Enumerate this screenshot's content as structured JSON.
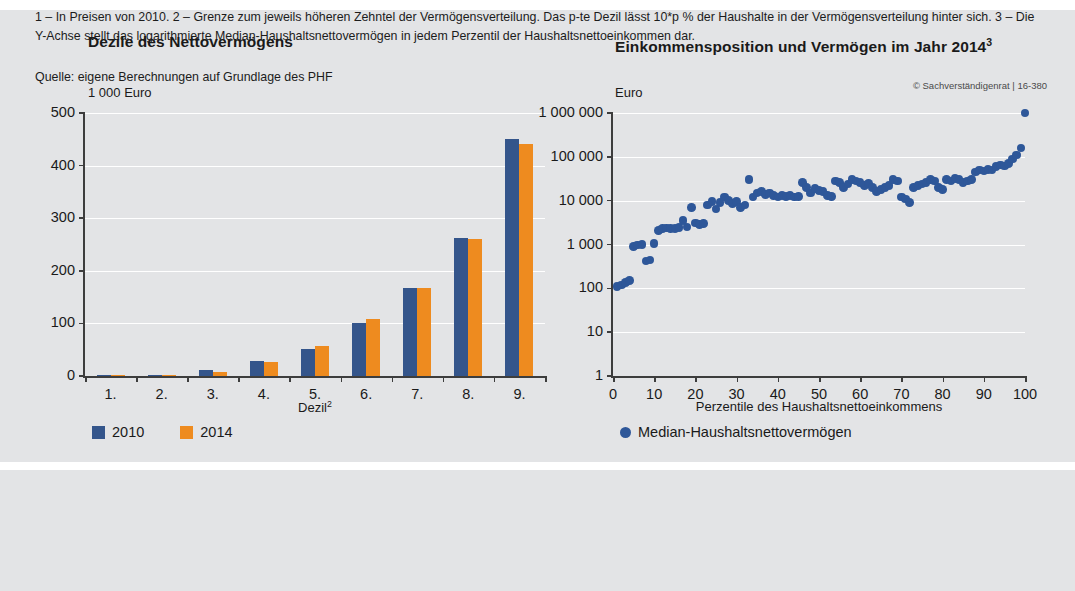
{
  "left_chart": {
    "title": "Dezile des Nettovermögens",
    "y_unit": "1 000 Euro",
    "x_axis_label": "Dezil",
    "x_axis_label_sup": "2",
    "y_ticks": [
      "0",
      "100",
      "200",
      "300",
      "400",
      "500"
    ],
    "x_ticks": [
      "1.",
      "2.",
      "3.",
      "4.",
      "5.",
      "6.",
      "7.",
      "8.",
      "9."
    ],
    "legend": [
      {
        "label": "2010",
        "color": "#34558b"
      },
      {
        "label": "2014",
        "color": "#ee8b1f"
      }
    ]
  },
  "right_chart": {
    "title": "Einkommensposition und Vermögen im Jahr 2014",
    "title_sup": "3",
    "y_unit": "Euro",
    "x_axis_label": "Perzentile des Haushaltsnettoeinkommens",
    "y_ticks": [
      "1",
      "10",
      "100",
      "1 000",
      "10 000",
      "100 000",
      "1 000 000"
    ],
    "x_ticks": [
      "0",
      "10",
      "20",
      "30",
      "40",
      "50",
      "60",
      "70",
      "80",
      "90",
      "100"
    ],
    "legend": [
      {
        "label": "Median-Haushaltsnettovermögen",
        "color": "#2e5799"
      }
    ]
  },
  "footnotes": "1 – In Preisen von 2010.  2 – Grenze zum jeweils höheren Zehntel der Vermögensverteilung. Das p-te Dezil lässt 10*p % der Haushalte in der Vermögensverteilung hinter sich.  3 – Die Y-Achse stellt das logarithmierte Median-Haushaltsnettovermögen in jedem Perzentil der Haushaltsnettoeinkommen dar.",
  "source": "Quelle: eigene Berechnungen auf Grundlage des PHF",
  "copyright": "© Sachverständigenrat | 16-380",
  "colors": {
    "background": "#e3e4e6",
    "series_2010": "#34558b",
    "series_2014": "#ee8b1f",
    "scatter": "#2e5799",
    "axis": "#3d3d3d",
    "gridline": "#ffffff"
  },
  "chart_data": [
    {
      "type": "bar",
      "title": "Dezile des Nettovermögens",
      "xlabel": "Dezil",
      "ylabel": "1 000 Euro",
      "ylim": [
        0,
        500
      ],
      "grid": true,
      "legend_position": "bottom-left",
      "categories": [
        "1.",
        "2.",
        "3.",
        "4.",
        "5.",
        "6.",
        "7.",
        "8.",
        "9."
      ],
      "series": [
        {
          "name": "2010",
          "color": "#34558b",
          "values": [
            0.3,
            2.5,
            11,
            28,
            51,
            100,
            168,
            262,
            450
          ]
        },
        {
          "name": "2014",
          "color": "#ee8b1f",
          "values": [
            0.2,
            1.8,
            8,
            26,
            58,
            108,
            168,
            260,
            441
          ]
        }
      ]
    },
    {
      "type": "scatter",
      "title": "Einkommensposition und Vermögen im Jahr 2014",
      "xlabel": "Perzentile des Haushaltsnettoeinkommens",
      "ylabel": "Euro",
      "yscale": "log",
      "ylim": [
        1,
        1000000
      ],
      "xlim": [
        0,
        100
      ],
      "grid": true,
      "legend_position": "bottom-left",
      "series": [
        {
          "name": "Median-Haushaltsnettovermögen",
          "color": "#2e5799",
          "points": [
            [
              1,
              110
            ],
            [
              2,
              120
            ],
            [
              3,
              135
            ],
            [
              4,
              150
            ],
            [
              5,
              900
            ],
            [
              6,
              980
            ],
            [
              7,
              1000
            ],
            [
              8,
              420
            ],
            [
              9,
              440
            ],
            [
              10,
              1050
            ],
            [
              11,
              2100
            ],
            [
              12,
              2300
            ],
            [
              13,
              2400
            ],
            [
              14,
              2300
            ],
            [
              15,
              2350
            ],
            [
              16,
              2450
            ],
            [
              17,
              3500
            ],
            [
              18,
              2500
            ],
            [
              19,
              7000
            ],
            [
              20,
              3100
            ],
            [
              21,
              2900
            ],
            [
              22,
              3000
            ],
            [
              23,
              8000
            ],
            [
              24,
              9500
            ],
            [
              25,
              6500
            ],
            [
              26,
              9000
            ],
            [
              27,
              12000
            ],
            [
              28,
              10000
            ],
            [
              29,
              8500
            ],
            [
              30,
              9500
            ],
            [
              31,
              7000
            ],
            [
              32,
              8000
            ],
            [
              33,
              30000
            ],
            [
              34,
              12000
            ],
            [
              35,
              15000
            ],
            [
              36,
              16000
            ],
            [
              37,
              14000
            ],
            [
              38,
              15000
            ],
            [
              39,
              13000
            ],
            [
              40,
              12000
            ],
            [
              41,
              13000
            ],
            [
              42,
              12500
            ],
            [
              43,
              13000
            ],
            [
              44,
              12000
            ],
            [
              45,
              12500
            ],
            [
              46,
              26000
            ],
            [
              47,
              20000
            ],
            [
              48,
              15000
            ],
            [
              49,
              19000
            ],
            [
              50,
              17000
            ],
            [
              51,
              16000
            ],
            [
              52,
              13000
            ],
            [
              53,
              12500
            ],
            [
              54,
              28000
            ],
            [
              55,
              26000
            ],
            [
              56,
              20000
            ],
            [
              57,
              24000
            ],
            [
              58,
              30000
            ],
            [
              59,
              28000
            ],
            [
              60,
              26000
            ],
            [
              61,
              22000
            ],
            [
              62,
              25000
            ],
            [
              63,
              20000
            ],
            [
              64,
              16000
            ],
            [
              65,
              18000
            ],
            [
              66,
              20000
            ],
            [
              67,
              22000
            ],
            [
              68,
              30000
            ],
            [
              69,
              28000
            ],
            [
              70,
              12000
            ],
            [
              71,
              11000
            ],
            [
              72,
              9000
            ],
            [
              73,
              20000
            ],
            [
              74,
              22000
            ],
            [
              75,
              24000
            ],
            [
              76,
              26000
            ],
            [
              77,
              30000
            ],
            [
              78,
              28000
            ],
            [
              79,
              20000
            ],
            [
              80,
              18000
            ],
            [
              81,
              30000
            ],
            [
              82,
              28000
            ],
            [
              83,
              32000
            ],
            [
              84,
              30000
            ],
            [
              85,
              26000
            ],
            [
              86,
              28000
            ],
            [
              87,
              30000
            ],
            [
              88,
              45000
            ],
            [
              89,
              50000
            ],
            [
              90,
              48000
            ],
            [
              91,
              52000
            ],
            [
              92,
              50000
            ],
            [
              93,
              60000
            ],
            [
              94,
              65000
            ],
            [
              95,
              62000
            ],
            [
              96,
              70000
            ],
            [
              97,
              90000
            ],
            [
              98,
              110000
            ],
            [
              99,
              160000
            ],
            [
              100,
              1000000
            ]
          ]
        }
      ]
    }
  ]
}
